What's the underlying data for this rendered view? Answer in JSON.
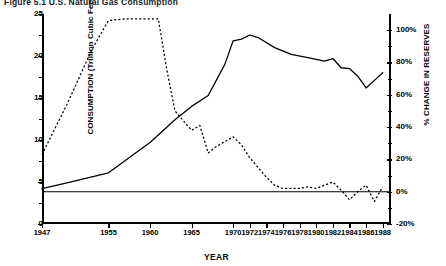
{
  "figure": {
    "title": "Figure 5.1  U.S. Natural Gas Consumption"
  },
  "chart_data": {
    "type": "line",
    "title": "Figure 5.1  U.S. Natural Gas Consumption",
    "xlabel": "YEAR",
    "ylabel": "CONSUMPTION (Trillion Cubic Feet)",
    "y2label": "% CHANGE IN RESERVES",
    "xlim": [
      1947,
      1989
    ],
    "ylim": [
      0,
      25
    ],
    "y2lim": [
      -20,
      110
    ],
    "grid": false,
    "legend": "none",
    "x_tick_labels": [
      "1947",
      "1955",
      "1960",
      "1965",
      "1970",
      "1972",
      "1974",
      "1976",
      "1978",
      "1980",
      "1982",
      "1984",
      "1986",
      "1988"
    ],
    "x_tick_values": [
      1947,
      1955,
      1960,
      1965,
      1970,
      1972,
      1974,
      1976,
      1978,
      1980,
      1982,
      1984,
      1986,
      1988
    ],
    "y_tick_labels": [
      "0",
      "5",
      "10",
      "15",
      "20",
      "25"
    ],
    "y_tick_values": [
      0,
      5,
      10,
      15,
      20,
      25
    ],
    "y2_tick_labels": [
      "-20%",
      "0%",
      "20%",
      "40%",
      "60%",
      "80%",
      "100%"
    ],
    "y2_tick_values": [
      -20,
      0,
      20,
      40,
      60,
      80,
      100
    ],
    "reference_line": {
      "axis": "y2",
      "value": 0,
      "style": "solid"
    },
    "series": [
      {
        "name": "CONSUMPTION (Trillion Cubic Feet)",
        "axis": "left",
        "style": "solid",
        "x": [
          1947,
          1950,
          1955,
          1960,
          1963,
          1965,
          1967,
          1969,
          1970,
          1971,
          1972,
          1973,
          1975,
          1977,
          1979,
          1980,
          1981,
          1982,
          1983,
          1984,
          1985,
          1986,
          1987,
          1988
        ],
        "values": [
          4.2,
          4.9,
          6.1,
          9.7,
          12.4,
          14.0,
          15.3,
          19.0,
          21.8,
          22.0,
          22.5,
          22.2,
          21.0,
          20.2,
          19.8,
          19.6,
          19.4,
          19.7,
          18.6,
          18.5,
          17.6,
          16.2,
          17.1,
          18.0
        ]
      },
      {
        "name": "% CHANGE IN RESERVES",
        "axis": "right",
        "style": "dotted",
        "x": [
          1947,
          1950,
          1953,
          1955,
          1957,
          1959,
          1960,
          1961,
          1962,
          1963,
          1965,
          1966,
          1967,
          1968,
          1969,
          1970,
          1971,
          1972,
          1974,
          1975,
          1976,
          1977,
          1978,
          1979,
          1980,
          1981,
          1982,
          1983,
          1984,
          1985,
          1986,
          1987,
          1988
        ],
        "values": [
          23,
          54,
          88,
          106,
          107,
          107,
          107,
          107,
          76,
          50,
          38,
          41,
          24,
          28,
          31,
          34,
          29,
          21,
          9,
          4,
          2,
          2,
          2,
          3,
          2,
          4,
          6,
          1,
          -5,
          0,
          4,
          -6,
          3
        ]
      }
    ]
  }
}
